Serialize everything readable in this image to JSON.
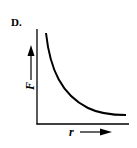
{
  "diagram": {
    "option_label": "D.",
    "y_axis_label": "F",
    "x_axis_label": "r",
    "curve": "decreasing convex curve (inverse relationship)",
    "colors": {
      "line": "#000000",
      "background": "#ffffff"
    }
  }
}
